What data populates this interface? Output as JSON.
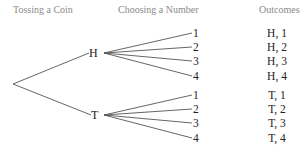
{
  "headers": {
    "coin": "Tossing a Coin",
    "number": "Choosing a Number",
    "outcomes": "Outcomes"
  },
  "coin_nodes": [
    "H",
    "T"
  ],
  "numbers": [
    "1",
    "2",
    "3",
    "4"
  ],
  "outcomes": [
    "H, 1",
    "H, 2",
    "H, 3",
    "H, 4",
    "T, 1",
    "T, 2",
    "T, 3",
    "T, 4"
  ],
  "colors": {
    "line": "#555555",
    "header": "#8a8a8a",
    "text": "#222222"
  }
}
